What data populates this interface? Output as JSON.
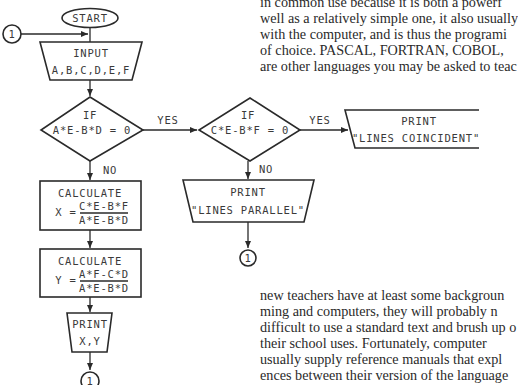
{
  "page_text": {
    "top_lines": [
      "in common use because it is both a powerf",
      "well as a relatively simple one, it also usually",
      "with the computer, and is thus the programi",
      "of choice. PASCAL, FORTRAN, COBOL,",
      "are other languages you may be asked to teac"
    ],
    "bottom_lines": [
      "new teachers have at least some backgroun",
      "ming and computers, they will probably n",
      "difficult to use a standard text and brush up o",
      "their school uses. Fortunately, computer",
      "usually supply reference manuals that expl",
      "ences between their version of the language"
    ]
  },
  "flowchart": {
    "start": "START",
    "connector_label": "1",
    "input": {
      "title": "INPUT",
      "vars": "A,B,C,D,E,F"
    },
    "decision1": {
      "title": "IF",
      "cond": "A*E-B*D = 0",
      "yes": "YES",
      "no": "NO"
    },
    "decision2": {
      "title": "IF",
      "cond": "C*E-B*F = 0",
      "yes": "YES",
      "no": "NO"
    },
    "calc_x": {
      "title": "CALCULATE",
      "lhs": "X  =",
      "num": "C*E-B*F",
      "den": "A*E-B*D"
    },
    "calc_y": {
      "title": "CALCULATE",
      "lhs": "Y  =",
      "num": "A*F-C*D",
      "den": "A*E-B*D"
    },
    "print_xy": {
      "title": "PRINT",
      "value": "X,Y"
    },
    "print_parallel": {
      "title": "PRINT",
      "value": "\"LINES PARALLEL\""
    },
    "print_coincident": {
      "title": "PRINT",
      "value": "\"LINES COINCIDENT\""
    }
  }
}
